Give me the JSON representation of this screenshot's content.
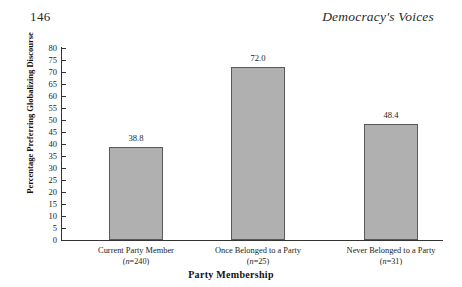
{
  "running_head": {
    "page_number": "146",
    "book_title": "Democracy's Voices"
  },
  "chart_data": {
    "type": "bar",
    "title": "",
    "xlabel": "Party Membership",
    "ylabel": "Percentage Preferring Globalizing Discourse",
    "categories": [
      "Current Party Member",
      "Once Belonged to a Party",
      "Never Belonged to a Party"
    ],
    "category_notes": [
      "(n=240)",
      "(n=25)",
      "(n=31)"
    ],
    "sample_sizes": [
      240,
      25,
      31
    ],
    "values": [
      38.8,
      72.0,
      48.4
    ],
    "value_labels": [
      "38.8",
      "72.0",
      "48.4"
    ],
    "ylim": [
      0,
      80
    ],
    "ytick_step": 5,
    "yticks": [
      "80",
      "75",
      "70",
      "65",
      "60",
      "55",
      "50",
      "45",
      "40",
      "35",
      "30",
      "25",
      "20",
      "15",
      "10",
      "5",
      "0"
    ],
    "grid": false,
    "legend": false,
    "bar_fill_color": "#b0b0b0",
    "bar_border_color": "#595959",
    "axis_color": "#333333",
    "background_color": "#ffffff"
  }
}
